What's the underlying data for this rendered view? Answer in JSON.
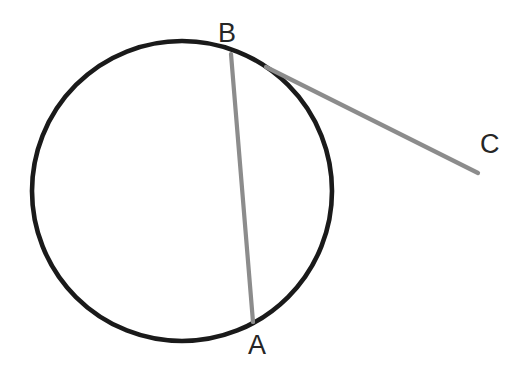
{
  "figure": {
    "background_color": "#ffffff",
    "width": 524,
    "height": 368
  },
  "circle": {
    "name": "circle-outline",
    "center_x": 182,
    "center_y": 191,
    "radius": 150,
    "stroke_color": "#1a1a1a",
    "stroke_width": 4.6,
    "fill": "none"
  },
  "segments": [
    {
      "name": "chord-ab",
      "label": "chord BA",
      "x1": 231,
      "y1": 54,
      "x2": 253,
      "y2": 322,
      "stroke_color": "#8c8c8c",
      "stroke_width": 4.2
    },
    {
      "name": "tangent-bc",
      "label": "tangent to C",
      "x1": 266,
      "y1": 67,
      "x2": 478,
      "y2": 173,
      "stroke_color": "#8c8c8c",
      "stroke_width": 4.2
    }
  ],
  "labels": {
    "point_b": "B",
    "point_a": "A",
    "point_c": "C",
    "color": "#262626"
  },
  "chart_data": {
    "type": "diagram",
    "elements": [
      {
        "kind": "circle",
        "center": [
          182,
          191
        ],
        "radius": 150,
        "color": "#1a1a1a"
      },
      {
        "kind": "line",
        "label": "BA",
        "from": [
          231,
          54
        ],
        "to": [
          253,
          322
        ],
        "color": "#8c8c8c"
      },
      {
        "kind": "line",
        "label": "BC",
        "from": [
          266,
          67
        ],
        "to": [
          478,
          173
        ],
        "color": "#8c8c8c"
      }
    ],
    "points": [
      {
        "label": "B",
        "x": 231,
        "y": 54,
        "label_x": 228,
        "label_y": 32
      },
      {
        "label": "A",
        "x": 253,
        "y": 322,
        "label_x": 258,
        "label_y": 347
      },
      {
        "label": "C",
        "x": 478,
        "y": 173,
        "label_x": 490,
        "label_y": 145
      }
    ]
  }
}
